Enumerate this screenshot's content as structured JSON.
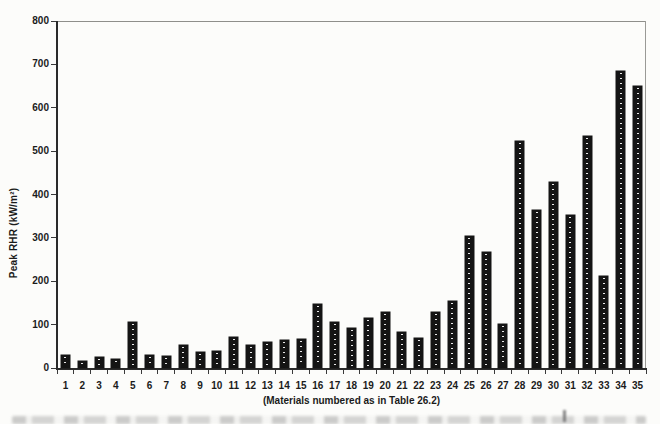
{
  "chart_data": {
    "type": "bar",
    "title": "",
    "xlabel": "(Materials numbered as in Table 26.2)",
    "ylabel": "Peak RHR (kW/m²)",
    "categories": [
      "1",
      "2",
      "3",
      "4",
      "5",
      "6",
      "7",
      "8",
      "9",
      "10",
      "11",
      "12",
      "13",
      "14",
      "15",
      "16",
      "17",
      "18",
      "19",
      "20",
      "21",
      "22",
      "23",
      "24",
      "25",
      "26",
      "27",
      "28",
      "29",
      "30",
      "31",
      "32",
      "33",
      "34",
      "35"
    ],
    "values": [
      30,
      17,
      25,
      21,
      105,
      30,
      27,
      54,
      38,
      40,
      72,
      52,
      59,
      65,
      68,
      147,
      105,
      92,
      115,
      128,
      82,
      69,
      128,
      154,
      305,
      267,
      102,
      524,
      364,
      429,
      353,
      535,
      212,
      685,
      650
    ],
    "ylim": [
      0,
      800
    ],
    "yticks": [
      0,
      100,
      200,
      300,
      400,
      500,
      600,
      700,
      800
    ],
    "grid": false,
    "legend": "none",
    "bar_color": "#141414",
    "bar_texture": "central-white-dotted-line",
    "frame": "box"
  }
}
